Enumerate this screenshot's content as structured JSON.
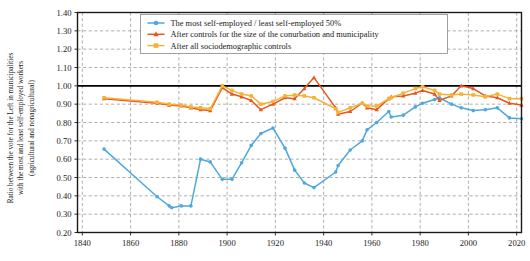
{
  "axes": {
    "ylabel_line1": "Ratio between the vote for the Left in municipalities",
    "ylabel_line2": "with the most and least self-employed workers",
    "ylabel_line3": "(agricultural and nonagricultural)",
    "xlabel": "",
    "xticks": [
      "1840",
      "1860",
      "1880",
      "1900",
      "1920",
      "1940",
      "1960",
      "1980",
      "2000",
      "2020"
    ],
    "yticks": [
      "0.20",
      "0.30",
      "0.40",
      "0.50",
      "0.60",
      "0.70",
      "0.80",
      "0.90",
      "1.00",
      "1.10",
      "1.20",
      "1.30",
      "1.40"
    ]
  },
  "legend": {
    "items": [
      {
        "label": "The most self-employed / least self-employed 50%",
        "color": "#4fa8dc",
        "marker": "circle"
      },
      {
        "label": "After controls for the size of the conurbation and municipality",
        "color": "#e8551f",
        "marker": "triangle"
      },
      {
        "label": "After all sociodemographic controls",
        "color": "#f5b335",
        "marker": "square"
      }
    ]
  },
  "colors": {
    "blue": "#4fa8dc",
    "orange_red": "#e8551f",
    "yellow_orange": "#f5b335",
    "reference_line": "#000000",
    "grid": "#9a9a9a",
    "axis": "#1a1a1a"
  },
  "chart_data": {
    "type": "line",
    "title": "",
    "xlabel": "",
    "ylabel": "Ratio between the vote for the Left in municipalities with the most and least self-employed workers (agricultural and nonagricultural)",
    "xlim": [
      1838,
      2022
    ],
    "ylim": [
      0.2,
      1.4
    ],
    "grid": true,
    "legend_position": "top-center",
    "reference_line_y": 1.0,
    "series": [
      {
        "name": "The most self-employed / least self-employed 50%",
        "color": "#4fa8dc",
        "marker": "circle",
        "points": [
          [
            1849,
            0.655
          ],
          [
            1871,
            0.395
          ],
          [
            1876,
            0.345
          ],
          [
            1877,
            0.335
          ],
          [
            1881,
            0.345
          ],
          [
            1885,
            0.345
          ],
          [
            1889,
            0.6
          ],
          [
            1893,
            0.585
          ],
          [
            1898,
            0.49
          ],
          [
            1902,
            0.49
          ],
          [
            1906,
            0.58
          ],
          [
            1910,
            0.675
          ],
          [
            1914,
            0.74
          ],
          [
            1919,
            0.77
          ],
          [
            1924,
            0.66
          ],
          [
            1928,
            0.54
          ],
          [
            1932,
            0.47
          ],
          [
            1936,
            0.445
          ],
          [
            1945,
            0.53
          ],
          [
            1946,
            0.565
          ],
          [
            1951,
            0.65
          ],
          [
            1956,
            0.7
          ],
          [
            1958,
            0.76
          ],
          [
            1962,
            0.8
          ],
          [
            1967,
            0.86
          ],
          [
            1968,
            0.83
          ],
          [
            1973,
            0.84
          ],
          [
            1978,
            0.885
          ],
          [
            1981,
            0.905
          ],
          [
            1986,
            0.925
          ],
          [
            1988,
            0.935
          ],
          [
            1993,
            0.9
          ],
          [
            1997,
            0.88
          ],
          [
            2002,
            0.865
          ],
          [
            2007,
            0.87
          ],
          [
            2012,
            0.88
          ],
          [
            2017,
            0.825
          ],
          [
            2022,
            0.82
          ]
        ]
      },
      {
        "name": "After controls for the size of the conurbation and municipality",
        "color": "#e8551f",
        "marker": "triangle",
        "points": [
          [
            1849,
            0.93
          ],
          [
            1871,
            0.905
          ],
          [
            1876,
            0.895
          ],
          [
            1881,
            0.89
          ],
          [
            1885,
            0.88
          ],
          [
            1889,
            0.87
          ],
          [
            1893,
            0.865
          ],
          [
            1898,
            0.99
          ],
          [
            1902,
            0.955
          ],
          [
            1906,
            0.94
          ],
          [
            1910,
            0.92
          ],
          [
            1914,
            0.87
          ],
          [
            1919,
            0.9
          ],
          [
            1924,
            0.935
          ],
          [
            1928,
            0.93
          ],
          [
            1932,
            0.985
          ],
          [
            1936,
            1.045
          ],
          [
            1945,
            0.88
          ],
          [
            1946,
            0.845
          ],
          [
            1951,
            0.86
          ],
          [
            1956,
            0.905
          ],
          [
            1958,
            0.88
          ],
          [
            1962,
            0.87
          ],
          [
            1967,
            0.93
          ],
          [
            1968,
            0.94
          ],
          [
            1973,
            0.945
          ],
          [
            1978,
            0.96
          ],
          [
            1981,
            0.975
          ],
          [
            1986,
            0.955
          ],
          [
            1988,
            0.92
          ],
          [
            1993,
            0.945
          ],
          [
            1997,
            1.0
          ],
          [
            2002,
            0.985
          ],
          [
            2007,
            0.945
          ],
          [
            2012,
            0.935
          ],
          [
            2017,
            0.905
          ],
          [
            2022,
            0.895
          ]
        ]
      },
      {
        "name": "After all sociodemographic controls",
        "color": "#f5b335",
        "marker": "square",
        "points": [
          [
            1849,
            0.935
          ],
          [
            1871,
            0.91
          ],
          [
            1876,
            0.9
          ],
          [
            1881,
            0.895
          ],
          [
            1885,
            0.885
          ],
          [
            1889,
            0.88
          ],
          [
            1893,
            0.875
          ],
          [
            1898,
            1.0
          ],
          [
            1902,
            0.975
          ],
          [
            1906,
            0.955
          ],
          [
            1910,
            0.945
          ],
          [
            1914,
            0.9
          ],
          [
            1919,
            0.915
          ],
          [
            1924,
            0.945
          ],
          [
            1928,
            0.95
          ],
          [
            1932,
            0.945
          ],
          [
            1936,
            0.935
          ],
          [
            1945,
            0.875
          ],
          [
            1946,
            0.855
          ],
          [
            1951,
            0.88
          ],
          [
            1956,
            0.905
          ],
          [
            1958,
            0.89
          ],
          [
            1962,
            0.89
          ],
          [
            1967,
            0.93
          ],
          [
            1968,
            0.935
          ],
          [
            1973,
            0.96
          ],
          [
            1978,
            0.985
          ],
          [
            1981,
            0.995
          ],
          [
            1986,
            0.975
          ],
          [
            1988,
            0.955
          ],
          [
            1993,
            0.95
          ],
          [
            1997,
            0.955
          ],
          [
            2002,
            0.95
          ],
          [
            2007,
            0.94
          ],
          [
            2012,
            0.955
          ],
          [
            2017,
            0.93
          ],
          [
            2022,
            0.93
          ]
        ]
      }
    ]
  }
}
